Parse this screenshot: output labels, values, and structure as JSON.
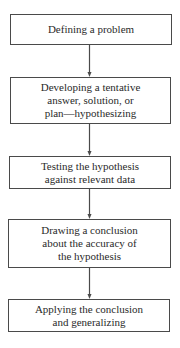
{
  "diagram": {
    "type": "flowchart",
    "direction": "top-to-bottom",
    "cropped_header_text": "",
    "steps": [
      {
        "id": "step-1",
        "label": "Defining a problem"
      },
      {
        "id": "step-2",
        "label": "Developing a tentative\nanswer, solution, or\nplan—hypothesizing"
      },
      {
        "id": "step-3",
        "label": "Testing the hypothesis\nagainst relevant data"
      },
      {
        "id": "step-4",
        "label": "Drawing a conclusion\nabout the accuracy of\nthe hypothesis"
      },
      {
        "id": "step-5",
        "label": "Applying the conclusion\nand generalizing"
      }
    ],
    "connections": [
      {
        "from": "step-1",
        "to": "step-2"
      },
      {
        "from": "step-2",
        "to": "step-3"
      },
      {
        "from": "step-3",
        "to": "step-4"
      },
      {
        "from": "step-4",
        "to": "step-5"
      }
    ],
    "colors": {
      "line": "#4a4a4a",
      "text": "#2a2a2a",
      "background": "#ffffff"
    }
  }
}
